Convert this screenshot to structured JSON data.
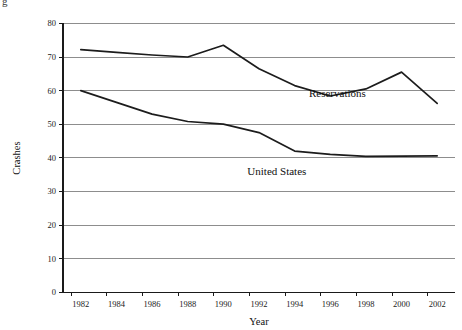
{
  "corner": {
    "mark": "g"
  },
  "chart_data": {
    "type": "line",
    "title": "",
    "xlabel": "Year",
    "ylabel": "Crashes",
    "xlim": [
      1981,
      2003
    ],
    "ylim": [
      0,
      80
    ],
    "grid": true,
    "legend": "inline-annotations",
    "x_ticks": [
      1982,
      1984,
      1986,
      1988,
      1990,
      1992,
      1994,
      1996,
      1998,
      2000,
      2002
    ],
    "x_tick_labels": [
      "1982",
      "1984",
      "1986",
      "1988",
      "1990",
      "1992",
      "1994",
      "1996",
      "1998",
      "2000",
      "2002"
    ],
    "y_ticks": [
      0,
      10,
      20,
      30,
      40,
      50,
      60,
      70,
      80
    ],
    "y_tick_labels": [
      "0",
      "10",
      "20",
      "30",
      "40",
      "50",
      "60",
      "70",
      "80"
    ],
    "series": [
      {
        "name": "Reservations",
        "label_x": 1996.4,
        "label_y": 58.0,
        "x": [
          1982,
          1984,
          1986,
          1988,
          1990,
          1992,
          1994,
          1996,
          1998,
          2000,
          2002
        ],
        "values": [
          72.2,
          71.4,
          70.6,
          70.0,
          73.5,
          66.5,
          61.5,
          58.4,
          60.5,
          65.5,
          56.2
        ]
      },
      {
        "name": "United States",
        "label_x": 1993.0,
        "label_y": 35.0,
        "x": [
          1982,
          1984,
          1986,
          1988,
          1990,
          1992,
          1994,
          1996,
          1998,
          2000,
          2002
        ],
        "values": [
          60.0,
          56.5,
          53.0,
          50.8,
          50.0,
          47.5,
          42.0,
          41.0,
          40.4,
          40.5,
          40.6
        ]
      }
    ]
  }
}
